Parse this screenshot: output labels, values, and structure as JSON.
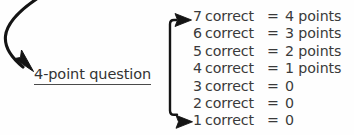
{
  "diagram": {
    "title_label": "4-point question",
    "incoming_arrow_icon": "curved-arrow-down-right-icon",
    "bracket_icon": "brace-bracket-with-arrows-icon",
    "top_branch_arrow_icon": "arrow-right-icon",
    "bottom_branch_arrow_icon": "arrow-right-icon",
    "ink_color": "#1a1a1a",
    "text_color": "#3a3a3a",
    "background_color": "#fefefe",
    "outcomes": [
      {
        "count": "7",
        "correct_word": "correct",
        "equals": "=",
        "score": "4 points"
      },
      {
        "count": "6",
        "correct_word": "correct",
        "equals": "=",
        "score": "3 points"
      },
      {
        "count": "5",
        "correct_word": "correct",
        "equals": "=",
        "score": "2 points"
      },
      {
        "count": "4",
        "correct_word": "correct",
        "equals": "=",
        "score": "1 points"
      },
      {
        "count": "3",
        "correct_word": "correct",
        "equals": "=",
        "score": "0"
      },
      {
        "count": "2",
        "correct_word": "correct",
        "equals": "=",
        "score": "0"
      },
      {
        "count": "1",
        "correct_word": "correct",
        "equals": "=",
        "score": "0"
      }
    ]
  }
}
